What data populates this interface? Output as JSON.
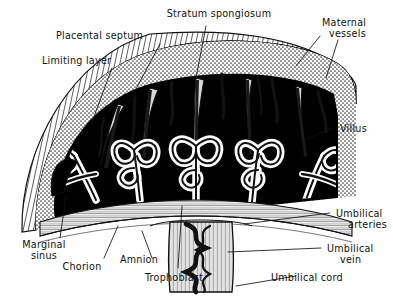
{
  "figure": {
    "background_color": "#ffffff",
    "ink_color": "#111111",
    "blood_space_color": "#000000",
    "decidua_color": "#8a8a8a",
    "villus_outline_color": "#ffffff"
  },
  "labels": {
    "stratum_spongiosum": "Stratum  spongiosum",
    "maternal_vessels_line1": "Maternal",
    "maternal_vessels_line2": "vessels",
    "placental_septum": "Placental  septum",
    "limiting_layer": "Limiting  layer",
    "villus": "Villus",
    "umbilical_arteries_line1": "Umbilical",
    "umbilical_arteries_line2": "arteries",
    "umbilical_vein_line1": "Umbilical",
    "umbilical_vein_line2": "vein",
    "umbilical_cord": "Umbilical  cord",
    "marginal_sinus_line1": "Marginal",
    "marginal_sinus_line2": "sinus",
    "chorion": "Chorion",
    "amnion": "Amnion",
    "trophoblast": "Trophoblast"
  }
}
